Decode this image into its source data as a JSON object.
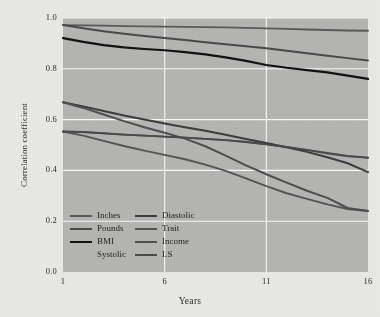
{
  "chart_data": {
    "type": "line",
    "title": "",
    "xlabel": "Years",
    "ylabel": "Correlation coefficient",
    "xlim": [
      1,
      16
    ],
    "ylim": [
      0.0,
      1.0
    ],
    "xticks": [
      "1",
      "6",
      "11",
      "16"
    ],
    "xtick_values": [
      1,
      6,
      11,
      16
    ],
    "yticks": [
      "0.0",
      "0.2",
      "0.4",
      "0.6",
      "0.8",
      "1.0"
    ],
    "ytick_values": [
      0.0,
      0.2,
      0.4,
      0.6,
      0.8,
      1.0
    ],
    "grid": true,
    "grid_color": "#ffffff",
    "plot_background": "#b5b5b3",
    "figure_background": "#e9e9e7",
    "legend_position": "lower left inside axes",
    "x": [
      1,
      2,
      3,
      4,
      5,
      6,
      7,
      8,
      9,
      10,
      11,
      12,
      13,
      14,
      15,
      16
    ],
    "series": [
      {
        "name": "Inches",
        "color": "#5a5a5a",
        "width": 1.9,
        "values": [
          0.972,
          0.971,
          0.97,
          0.968,
          0.967,
          0.966,
          0.965,
          0.964,
          0.963,
          0.961,
          0.959,
          0.957,
          0.955,
          0.953,
          0.951,
          0.95
        ]
      },
      {
        "name": "Pounds",
        "color": "#4a4a4a",
        "width": 2.0,
        "values": [
          0.972,
          0.96,
          0.948,
          0.938,
          0.929,
          0.921,
          0.913,
          0.905,
          0.897,
          0.889,
          0.881,
          0.871,
          0.861,
          0.851,
          0.842,
          0.833
        ]
      },
      {
        "name": "BMI",
        "color": "#121212",
        "width": 2.2,
        "values": [
          0.921,
          0.906,
          0.893,
          0.884,
          0.878,
          0.873,
          0.866,
          0.857,
          0.845,
          0.831,
          0.815,
          0.804,
          0.795,
          0.786,
          0.773,
          0.76
        ]
      },
      {
        "name": "Systolic",
        "color": "#606060",
        "width": 1.8,
        "values": [
          0.553,
          0.551,
          0.546,
          0.541,
          0.537,
          0.533,
          0.529,
          0.524,
          0.519,
          0.512,
          0.503,
          0.492,
          0.48,
          0.466,
          0.455,
          0.45
        ]
      },
      {
        "name": "Diastolic",
        "color": "#3c3c3c",
        "width": 2.0,
        "values": [
          0.668,
          0.652,
          0.634,
          0.616,
          0.6,
          0.585,
          0.57,
          0.556,
          0.54,
          0.524,
          0.508,
          0.491,
          0.473,
          0.452,
          0.428,
          0.393
        ]
      },
      {
        "name": "Trait",
        "color": "#555555",
        "width": 1.9,
        "values": [
          0.553,
          0.537,
          0.516,
          0.496,
          0.478,
          0.461,
          0.444,
          0.423,
          0.398,
          0.369,
          0.338,
          0.31,
          0.288,
          0.266,
          0.248,
          0.24
        ]
      },
      {
        "name": "Income",
        "color": "#4f4f4f",
        "width": 2.0,
        "values": [
          0.668,
          0.646,
          0.62,
          0.594,
          0.57,
          0.548,
          0.525,
          0.495,
          0.458,
          0.42,
          0.385,
          0.352,
          0.32,
          0.292,
          0.252,
          0.24
        ]
      },
      {
        "name": "LS",
        "color": "#4a4a4a",
        "width": 1.9,
        "values": [
          0.553,
          0.551,
          0.546,
          0.541,
          0.537,
          0.533,
          0.529,
          0.524,
          0.519,
          0.512,
          0.503,
          0.492,
          0.481,
          0.469,
          0.457,
          0.45
        ]
      }
    ]
  },
  "legend": {
    "columns": [
      {
        "entries": [
          {
            "label": "Inches",
            "color": "#5a5a5a",
            "width": 2.0,
            "has_swatch": true
          },
          {
            "label": "Pounds",
            "color": "#4a4a4a",
            "width": 2.2,
            "has_swatch": true
          },
          {
            "label": "BMI",
            "color": "#121212",
            "width": 2.6,
            "has_swatch": true
          },
          {
            "label": "Systolic",
            "color": "#606060",
            "width": 2.0,
            "has_swatch": false
          }
        ]
      },
      {
        "entries": [
          {
            "label": "Diastolic",
            "color": "#3c3c3c",
            "width": 2.2,
            "has_swatch": true
          },
          {
            "label": "Trait",
            "color": "#555555",
            "width": 2.2,
            "has_swatch": true
          },
          {
            "label": "Income",
            "color": "#4f4f4f",
            "width": 2.2,
            "has_swatch": true
          },
          {
            "label": "LS",
            "color": "#4a4a4a",
            "width": 2.2,
            "has_swatch": true
          }
        ]
      }
    ]
  }
}
